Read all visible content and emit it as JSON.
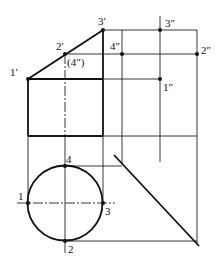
{
  "diagram": {
    "type": "orthographic-projection",
    "labels": {
      "p1_front": "1′",
      "p2_front": "2′",
      "p3_front": "3′",
      "p4_side_hidden": "(4″)",
      "p3_side": "3″",
      "p4_side": "4″",
      "p2_side": "2″",
      "p1_side": "1″",
      "p1_top": "1",
      "p2_top": "2",
      "p3_top": "3",
      "p4_top": "4"
    }
  }
}
